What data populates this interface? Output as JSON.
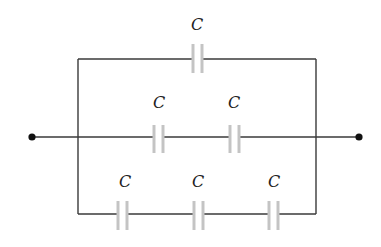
{
  "diagram": {
    "type": "capacitor-network",
    "terminals": [
      "left-terminal",
      "right-terminal"
    ],
    "branches": {
      "top": {
        "labels": [
          "C"
        ]
      },
      "middle": {
        "labels": [
          "C",
          "C"
        ]
      },
      "bottom": {
        "labels": [
          "C",
          "C",
          "C"
        ]
      }
    },
    "colors": {
      "wire": "#3a3a3a",
      "plate": "#c4c4c4",
      "node": "#111111"
    }
  }
}
